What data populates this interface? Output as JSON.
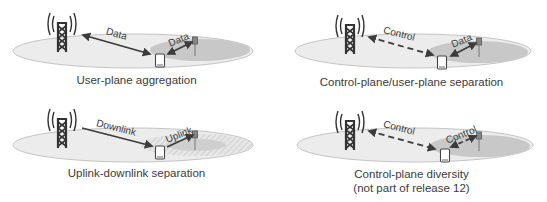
{
  "colors": {
    "arrow": "#3c3c3c",
    "ground": "#ececec",
    "ground_edge": "#c4c4c4",
    "small_cell_area": "#c8c8c8",
    "tower": "#333333",
    "caption_text": "#3a3a3a"
  },
  "panels": [
    {
      "id": "user-plane-aggregation",
      "caption": "User-plane aggregation",
      "macro_link": {
        "label": "Data",
        "style": "solid",
        "direction": "bidirectional"
      },
      "small_link": {
        "label": "Data",
        "style": "solid",
        "direction": "bidirectional"
      }
    },
    {
      "id": "control-user-plane-separation",
      "caption": "Control-plane/user-plane separation",
      "macro_link": {
        "label": "Control",
        "style": "dashed",
        "direction": "bidirectional"
      },
      "small_link": {
        "label": "Data",
        "style": "solid",
        "direction": "bidirectional"
      }
    },
    {
      "id": "uplink-downlink-separation",
      "caption": "Uplink-downlink separation",
      "macro_link": {
        "label": "Downlink",
        "style": "solid",
        "direction": "to-device"
      },
      "small_link": {
        "label": "Uplink",
        "style": "solid",
        "direction": "to-small-cell"
      }
    },
    {
      "id": "control-plane-diversity",
      "caption": "Control-plane diversity",
      "caption_line2": "(not part of release 12)",
      "macro_link": {
        "label": "Control",
        "style": "dashed",
        "direction": "bidirectional"
      },
      "small_link": {
        "label": "Control",
        "style": "dashed",
        "direction": "bidirectional"
      }
    }
  ]
}
